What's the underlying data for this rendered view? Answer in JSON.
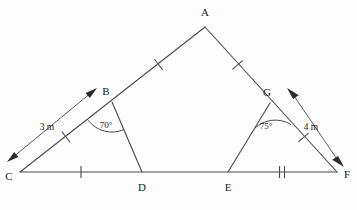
{
  "figure": {
    "background_color": "#fdfdfd",
    "line_color": "#4a4a4a",
    "label_color": "#1a1a1a",
    "vertices": {
      "A": {
        "label": "A",
        "x": 205,
        "y": 27,
        "label_x": 205,
        "label_y": 16
      },
      "B": {
        "label": "B",
        "x": 112,
        "y": 102,
        "label_x": 106,
        "label_y": 95
      },
      "C": {
        "label": "C",
        "x": 20,
        "y": 172,
        "label_x": 9,
        "label_y": 180
      },
      "D": {
        "label": "D",
        "x": 142,
        "y": 172,
        "label_x": 142,
        "label_y": 191
      },
      "E": {
        "label": "E",
        "x": 228,
        "y": 172,
        "label_x": 228,
        "label_y": 191
      },
      "F": {
        "label": "F",
        "x": 337,
        "y": 172,
        "label_x": 347,
        "label_y": 178
      },
      "G": {
        "label": "G",
        "x": 270,
        "y": 103,
        "label_x": 267,
        "label_y": 96
      }
    },
    "angles": [
      {
        "name": "angle-at-B",
        "value": "70°",
        "vertex": "B",
        "label_x": 106,
        "label_y": 128
      },
      {
        "name": "angle-at-G",
        "value": "75°",
        "vertex": "G",
        "label_x": 266,
        "label_y": 129
      }
    ],
    "measurements": [
      {
        "name": "left-dimension",
        "value": "3 m",
        "label_x": 47,
        "label_y": 130
      },
      {
        "name": "right-dimension",
        "value": "4 m",
        "label_x": 311,
        "label_y": 130
      }
    ],
    "segments": [
      {
        "name": "segment-CA",
        "from": "C",
        "to": "A",
        "ticks": 0
      },
      {
        "name": "segment-AF",
        "from": "A",
        "to": "F",
        "ticks": 0
      },
      {
        "name": "segment-CF",
        "from": "C",
        "to": "F",
        "ticks": 0
      },
      {
        "name": "segment-BD",
        "from": "B",
        "to": "D",
        "ticks": 0
      },
      {
        "name": "segment-GE",
        "from": "G",
        "to": "E",
        "ticks": 0
      }
    ],
    "tick_marks": [
      {
        "name": "tick-CB",
        "on": "C-B",
        "count": 1
      },
      {
        "name": "tick-BA",
        "on": "B-A",
        "count": 1
      },
      {
        "name": "tick-AG",
        "on": "A-G",
        "count": 1
      },
      {
        "name": "tick-GF",
        "on": "G-F",
        "count": 1
      },
      {
        "name": "tick-CD",
        "on": "C-D",
        "count": 1
      },
      {
        "name": "tick-EF",
        "on": "E-F",
        "count": 2
      }
    ]
  }
}
